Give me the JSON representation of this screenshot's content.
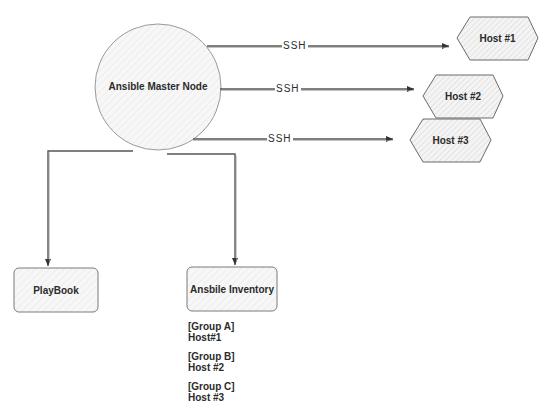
{
  "diagram": {
    "master": {
      "label": "Ansible Master Node"
    },
    "connections": [
      {
        "label": "SSH",
        "target": "Host #1"
      },
      {
        "label": "SSH",
        "target": "Host #2"
      },
      {
        "label": "SSH",
        "target": "Host #3"
      }
    ],
    "hosts": [
      {
        "label": "Host #1"
      },
      {
        "label": "Host #2"
      },
      {
        "label": "Host #3"
      }
    ],
    "playbook": {
      "label": "PlayBook"
    },
    "inventory": {
      "label": "Ansbile Inventory",
      "groups": [
        {
          "group": "[Group A]",
          "host": "Host#1"
        },
        {
          "group": "[Group B]",
          "host": "Host #2"
        },
        {
          "group": "[Group C]",
          "host": "Host #3"
        }
      ]
    },
    "colors": {
      "stroke": "#555555",
      "fill": "#f3f3f3",
      "hatch": "#cfcfcf",
      "text": "#2b2b2b",
      "background": "#ffffff"
    }
  }
}
